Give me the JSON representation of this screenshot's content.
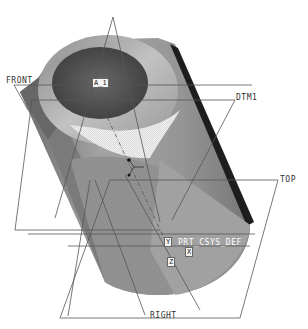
{
  "viewport": {
    "background": "#ffffff",
    "model": {
      "shape": "shaded cylindrical boss with bore",
      "shade_dark": "#5a5a5a",
      "shade_mid": "#9a9a9a",
      "shade_light": "#d8d8d8",
      "edge_dark": "#1a1a1a"
    },
    "datum_planes": [
      {
        "name": "FRONT",
        "label": "FRONT"
      },
      {
        "name": "DTM1",
        "label": "DTM1"
      },
      {
        "name": "TOP",
        "label": "TOP"
      },
      {
        "name": "RIGHT",
        "label": "RIGHT"
      }
    ],
    "axis": {
      "label": "A_1"
    },
    "csys": {
      "label": "PRT_CSYS_DEF",
      "x_label": "X",
      "y_label": "Y",
      "z_label": "Z"
    },
    "datum_color": "#555555"
  }
}
